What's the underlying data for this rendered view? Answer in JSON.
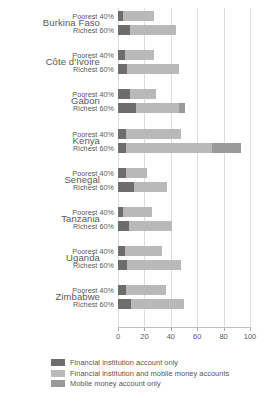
{
  "chart_data": {
    "type": "bar",
    "orientation": "horizontal",
    "stacked": true,
    "title": "",
    "subtitle": "",
    "xlabel": "",
    "ylabel": "",
    "xlim": [
      0,
      100
    ],
    "xticks": [
      0,
      20,
      40,
      60,
      80,
      100
    ],
    "xticklabels": [
      "0",
      "20",
      "40",
      "60",
      "80",
      "100"
    ],
    "grid": true,
    "legend_position": "bottom-left",
    "categories": [
      "Burkina Faso",
      "Côte d'Ivoire",
      "Gabon",
      "Kenya",
      "Senegal",
      "Tanzania",
      "Uganda",
      "Zimbabwe"
    ],
    "subcategories": [
      "Poorest 40%",
      "Richest 60%"
    ],
    "series": [
      {
        "name": "Financial institution account only",
        "color": "#6d6d6d",
        "values": {
          "Poorest 40%": [
            4,
            5,
            9,
            6,
            6,
            4,
            5,
            6
          ],
          "Richest 60%": [
            9,
            7,
            14,
            6,
            12,
            8,
            7,
            10
          ]
        }
      },
      {
        "name": "Financial institution and mobile money accounts",
        "color": "#b9b9b9",
        "values": {
          "Poorest 40%": [
            23,
            22,
            20,
            42,
            16,
            22,
            28,
            30
          ],
          "Richest 60%": [
            35,
            39,
            32,
            65,
            25,
            33,
            41,
            40
          ]
        }
      },
      {
        "name": "Mobile money account only",
        "color": "#9a9a9a",
        "values": {
          "Poorest 40%": [
            0,
            0,
            0,
            0,
            0,
            0,
            0,
            0
          ],
          "Richest 60%": [
            0,
            0,
            5,
            22,
            0,
            0,
            0,
            0
          ]
        }
      }
    ],
    "totals": {
      "Poorest 40%": [
        27,
        27,
        29,
        48,
        22,
        26,
        33,
        36
      ],
      "Richest 60%": [
        44,
        46,
        51,
        93,
        37,
        41,
        48,
        50
      ]
    }
  },
  "legend": {
    "items": [
      {
        "label": "Financial institution account only",
        "color": "#6d6d6d"
      },
      {
        "label": "Financial institution and mobile money accounts",
        "color": "#b9b9b9"
      },
      {
        "label": "Mobile money account only",
        "color": "#9a9a9a"
      }
    ]
  },
  "colors": {
    "series_1": "#6d6d6d",
    "series_2": "#b9b9b9",
    "series_3": "#9a9a9a",
    "grid": "#dcdcdc",
    "axis": "#bfbfbf",
    "text": "#585858",
    "background": "#ffffff"
  }
}
